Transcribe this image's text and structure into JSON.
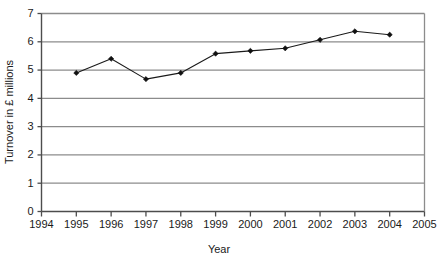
{
  "chart_data": {
    "type": "line",
    "title": "",
    "xlabel": "Year",
    "ylabel": "Turnover in £ millions",
    "x": [
      1995,
      1996,
      1997,
      1998,
      1999,
      2000,
      2001,
      2002,
      2003,
      2004
    ],
    "values": [
      4.9,
      5.4,
      4.68,
      4.9,
      5.58,
      5.68,
      5.77,
      6.07,
      6.37,
      6.25
    ],
    "series": [
      {
        "name": "Turnover",
        "values": [
          4.9,
          5.4,
          4.68,
          4.9,
          5.58,
          5.68,
          5.77,
          6.07,
          6.37,
          6.25
        ]
      }
    ],
    "xlim": [
      1994,
      2005
    ],
    "ylim": [
      0,
      7
    ],
    "x_ticks": [
      1994,
      1995,
      1996,
      1997,
      1998,
      1999,
      2000,
      2001,
      2002,
      2003,
      2004,
      2005
    ],
    "x_tick_labels": [
      "1994",
      "1995",
      "1996",
      "1997",
      "1998",
      "1999",
      "2000",
      "2001",
      "2002",
      "2003",
      "2004",
      "2005"
    ],
    "y_ticks": [
      0,
      1,
      2,
      3,
      4,
      5,
      6,
      7
    ],
    "y_tick_labels": [
      "0",
      "1",
      "2",
      "3",
      "4",
      "5",
      "6",
      "7"
    ],
    "grid": "horizontal",
    "legend": "none",
    "marker": "diamond",
    "line_color": "#1a1a1a",
    "grid_color": "#8c8c8c",
    "background_color": "#ffffff"
  }
}
